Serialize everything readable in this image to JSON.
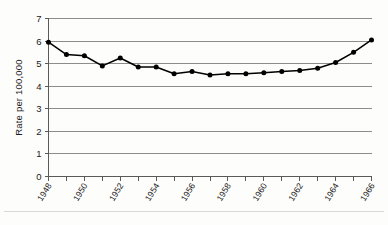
{
  "chart_data": {
    "type": "line",
    "title": "",
    "xlabel": "",
    "ylabel": "Rate per 100,000",
    "ylim": [
      0,
      7
    ],
    "yticks": [
      0,
      1,
      2,
      3,
      4,
      5,
      6,
      7
    ],
    "ytick_labels": [
      "0",
      "1",
      "2",
      "3",
      "4",
      "5",
      "6",
      "7"
    ],
    "xlim": [
      1948,
      1966
    ],
    "xticks": [
      1948,
      1949,
      1950,
      1951,
      1952,
      1953,
      1954,
      1955,
      1956,
      1957,
      1958,
      1959,
      1960,
      1961,
      1962,
      1963,
      1964,
      1965,
      1966
    ],
    "xtick_labels": [
      "1948",
      "",
      "1950",
      "",
      "1952",
      "",
      "1954",
      "",
      "1956",
      "",
      "1958",
      "",
      "1960",
      "",
      "1962",
      "",
      "1964",
      "",
      "1966"
    ],
    "x": [
      1948,
      1949,
      1950,
      1951,
      1952,
      1953,
      1954,
      1955,
      1956,
      1957,
      1958,
      1959,
      1960,
      1961,
      1962,
      1963,
      1964,
      1965,
      1966
    ],
    "values": [
      5.95,
      5.4,
      5.35,
      4.9,
      5.25,
      4.85,
      4.85,
      4.55,
      4.65,
      4.5,
      4.55,
      4.55,
      4.6,
      4.65,
      4.7,
      4.8,
      5.05,
      5.5,
      6.05
    ],
    "grid": true,
    "grid_axis": "y",
    "legend": "none",
    "series": [
      {
        "name": "rate",
        "marker": "filled-circle",
        "color": "#000000",
        "line_color": "#000000",
        "values": [
          5.95,
          5.4,
          5.35,
          4.9,
          5.25,
          4.85,
          4.85,
          4.55,
          4.65,
          4.5,
          4.55,
          4.55,
          4.6,
          4.65,
          4.7,
          4.8,
          5.05,
          5.5,
          6.05
        ]
      }
    ],
    "colors": {
      "line": "#000000",
      "marker": "#000000",
      "grid": "#8c8c8c",
      "axis": "#5a5a5a",
      "background": "#fdfdfc",
      "text": "#1a1a1a"
    }
  }
}
